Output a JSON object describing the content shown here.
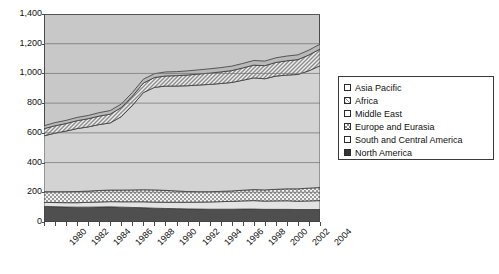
{
  "chart_data": {
    "type": "area",
    "stacked": true,
    "title": "",
    "xlabel": "",
    "ylabel": "",
    "ylim": [
      0,
      1400
    ],
    "ytick_labels": [
      "0",
      "200",
      "400",
      "600",
      "800",
      "1,000",
      "1,200",
      "1,400"
    ],
    "ytick_values": [
      0,
      200,
      400,
      600,
      800,
      1000,
      1200,
      1400
    ],
    "grid": true,
    "grid_axis": "y",
    "legend_position": "right",
    "x": [
      1979,
      1980,
      1981,
      1982,
      1983,
      1984,
      1985,
      1986,
      1987,
      1988,
      1989,
      1990,
      1991,
      1992,
      1993,
      1994,
      1995,
      1996,
      1997,
      1998,
      1999,
      2000,
      2001,
      2002,
      2003,
      2004
    ],
    "xtick_labels": [
      "1980",
      "1982",
      "1984",
      "1986",
      "1988",
      "1990",
      "1992",
      "1994",
      "1996",
      "1998",
      "2000",
      "2002",
      "2004"
    ],
    "xtick_values": [
      1980,
      1982,
      1984,
      1986,
      1988,
      1990,
      1992,
      1994,
      1996,
      1998,
      2000,
      2002,
      2004
    ],
    "series": [
      {
        "name": "North America",
        "fill": "solid-dark",
        "color": "#4f4f4f",
        "values": [
          105,
          103,
          101,
          100,
          100,
          101,
          102,
          100,
          98,
          96,
          93,
          91,
          90,
          88,
          87,
          86,
          86,
          86,
          87,
          87,
          85,
          85,
          85,
          84,
          84,
          84
        ]
      },
      {
        "name": "South and Central America",
        "fill": "solid-light",
        "color": "#e3e3e3",
        "values": [
          27,
          28,
          29,
          30,
          32,
          34,
          35,
          36,
          38,
          40,
          41,
          42,
          43,
          45,
          47,
          49,
          51,
          53,
          55,
          57,
          56,
          57,
          58,
          56,
          58,
          60
        ]
      },
      {
        "name": "Europe and Eurasia",
        "fill": "checker",
        "color": "#cccccc",
        "values": [
          72,
          73,
          74,
          75,
          76,
          77,
          78,
          79,
          80,
          81,
          82,
          80,
          76,
          72,
          70,
          69,
          69,
          70,
          72,
          74,
          75,
          78,
          80,
          83,
          86,
          88
        ]
      },
      {
        "name": "Middle East",
        "fill": "solid-lightgray",
        "color": "#d3d3d3",
        "values": [
          376,
          394,
          408,
          424,
          432,
          444,
          452,
          494,
          568,
          654,
          690,
          702,
          706,
          712,
          718,
          722,
          726,
          730,
          740,
          752,
          748,
          762,
          766,
          770,
          790,
          820
        ]
      },
      {
        "name": "Africa",
        "fill": "hatch",
        "color": "#dcdcdc",
        "values": [
          48,
          50,
          51,
          53,
          55,
          57,
          59,
          61,
          62,
          64,
          66,
          68,
          70,
          72,
          74,
          76,
          78,
          80,
          83,
          86,
          88,
          92,
          96,
          100,
          106,
          112
        ]
      },
      {
        "name": "Asia Pacific",
        "fill": "solid-midgray",
        "color": "#b9b9b9",
        "values": [
          20,
          21,
          21,
          22,
          22,
          23,
          24,
          24,
          25,
          26,
          26,
          27,
          27,
          28,
          28,
          29,
          29,
          30,
          30,
          31,
          31,
          31,
          32,
          32,
          33,
          33
        ]
      }
    ]
  },
  "legend": {
    "items": [
      {
        "label": "Asia Pacific"
      },
      {
        "label": "Africa"
      },
      {
        "label": "Middle East"
      },
      {
        "label": "Europe and Eurasia"
      },
      {
        "label": "South and Central America"
      },
      {
        "label": "North America"
      }
    ]
  }
}
